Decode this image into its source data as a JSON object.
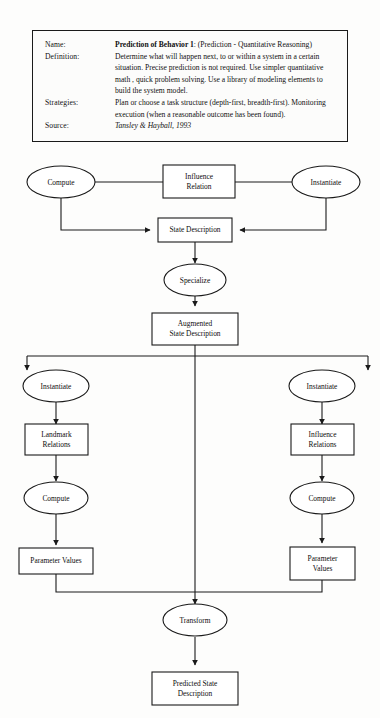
{
  "document": {
    "title": "Prediction of Behavior 1 Task Decomposition Diagram"
  },
  "card": {
    "rows": [
      {
        "label": "Name:",
        "value_bold": "Prediction of Behavior 1",
        "value_rest": ": (Prediction - Quantitative Reasoning)"
      },
      {
        "label": "Definition:",
        "value": "Determine what will happen next, to or within a system in a certain situation.  Precise prediction is not required.  Use simpler quantitative math , quick problem solving.  Use a library of modeling elements to build the system model."
      },
      {
        "label": "Strategies:",
        "value": "Plan or choose a task structure (depth-first, breadth-first). Monitoring execution (when a reasonable outcome has been found)."
      },
      {
        "label": "Source:",
        "value": "Tansley & Hayball, 1993"
      }
    ]
  },
  "diagram": {
    "nodes": {
      "compute_top_left": "Compute",
      "influence_relation_top": "Influence\nRelation",
      "instantiate_top_right": "Instantiate",
      "state_description": "State Description",
      "specialize": "Specialize",
      "augmented_state_description": "Augmented\nState Description",
      "instantiate_left": "Instantiate",
      "landmark_relations": "Landmark\nRelations",
      "compute_left": "Compute",
      "parameter_values_left": "Parameter Values",
      "instantiate_right": "Instantiate",
      "influence_relations_right": "Influence\nRelations",
      "compute_right": "Compute",
      "parameter_values_right": "Parameter\nValues",
      "transform": "Transform",
      "predicted_state_description": "Predicted State\nDescription"
    },
    "colors": {
      "stroke": "#1a1a1a",
      "fill": "#ffffff",
      "text": "#0d0d0d",
      "page": "#fdfdfc"
    }
  }
}
